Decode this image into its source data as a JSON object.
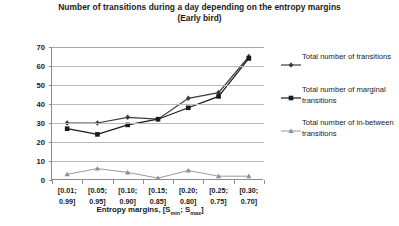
{
  "title": {
    "main": "Number of transitions during  a day depending on the entropy margins",
    "sub": "(Early bird)"
  },
  "axis": {
    "y_label": "Number of transitions",
    "x_label_prefix": "Entropy margins, [S",
    "x_label_sub1": "min",
    "x_label_mid": "; S",
    "x_label_sub2": "max",
    "x_label_suffix": "]"
  },
  "legend": {
    "items": [
      {
        "label": "Total number of transitions",
        "marker": "diamond-marker",
        "color": "#3b3b3b"
      },
      {
        "label": "Total number of marginal transitions",
        "marker": "square-marker",
        "color": "#1a1a1a"
      },
      {
        "label": "Total number of in-between transitions",
        "marker": "triangle-marker",
        "color": "#8f8f8f"
      }
    ]
  },
  "chart_data": {
    "type": "line",
    "title": "Number of transitions during  a day depending on the entropy margins (Early bird)",
    "xlabel": "Entropy margins, [Smin; Smax]",
    "ylabel": "Number of transitions",
    "ylim": [
      0,
      70
    ],
    "ytick_step": 10,
    "yticks": [
      "0",
      "10",
      "20",
      "30",
      "40",
      "50",
      "60",
      "70"
    ],
    "grid": true,
    "legend_position": "right",
    "categories": [
      "[0.01; 0.99]",
      "[0.05; 0.95]",
      "[0.10; 0.90]",
      "[0.15; 0.85]",
      "[0.20; 0.80]",
      "[0.25; 0.75]",
      "[0.30; 0.70]"
    ],
    "categories_lines": [
      [
        "[0.01;",
        "0.99]"
      ],
      [
        "[0.05;",
        "0.95]"
      ],
      [
        "[0.10;",
        "0.90]"
      ],
      [
        "[0.15;",
        "0.85]"
      ],
      [
        "[0.20;",
        "0.80]"
      ],
      [
        "[0.25;",
        "0.75]"
      ],
      [
        "[0.30;",
        "0.70]"
      ]
    ],
    "series": [
      {
        "name": "Total number of transitions",
        "marker": "diamond",
        "color": "#3b3b3b",
        "values": [
          30,
          30,
          33,
          32,
          43,
          46,
          65
        ]
      },
      {
        "name": "Total number of marginal transitions",
        "marker": "square",
        "color": "#1a1a1a",
        "values": [
          27,
          24,
          29,
          32,
          38,
          44,
          64
        ]
      },
      {
        "name": "Total number of in-between transitions",
        "marker": "triangle",
        "color": "#8f8f8f",
        "values": [
          3,
          6,
          4,
          1,
          5,
          2,
          2
        ]
      }
    ]
  }
}
